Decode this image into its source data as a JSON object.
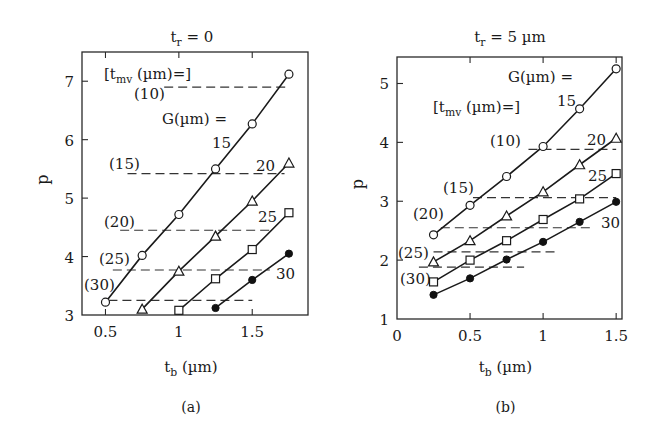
{
  "chart_data": [
    {
      "id": "a",
      "type": "line",
      "panel_label": "(a)",
      "title": "t_r = 0",
      "title_main": "t",
      "title_sub": "r",
      "title_rest": " = 0",
      "xlabel": "t_b (µm)",
      "xlabel_main": "t",
      "xlabel_sub": "b",
      "xlabel_rest": " (µm)",
      "ylabel": "p",
      "xlim": [
        0.34,
        1.88
      ],
      "ylim": [
        3,
        7.5
      ],
      "xticks": [
        0.5,
        1,
        1.5
      ],
      "xtick_labels": [
        "0.5",
        "1",
        "1.5"
      ],
      "yticks": [
        3,
        4,
        5,
        6,
        7
      ],
      "ytick_labels": [
        "3",
        "4",
        "5",
        "6",
        "7"
      ],
      "legend_header_g": "G(µm) =",
      "legend_header_tmv": "[t_mv (µm)=]",
      "series": [
        {
          "name": "G = 15",
          "marker": "circle-open",
          "x": [
            0.5,
            0.75,
            1.0,
            1.25,
            1.5,
            1.75
          ],
          "y": [
            3.22,
            4.02,
            4.72,
            5.5,
            6.27,
            7.12
          ],
          "label": "15"
        },
        {
          "name": "G = 20",
          "marker": "triangle-open",
          "x": [
            0.75,
            1.0,
            1.25,
            1.5,
            1.75
          ],
          "y": [
            3.1,
            3.75,
            4.35,
            4.95,
            5.6
          ],
          "label": "20"
        },
        {
          "name": "G = 25",
          "marker": "square-open",
          "x": [
            1.0,
            1.25,
            1.5,
            1.75
          ],
          "y": [
            3.08,
            3.62,
            4.12,
            4.75
          ],
          "label": "25"
        },
        {
          "name": "G = 30",
          "marker": "circle-filled",
          "x": [
            1.25,
            1.5,
            1.75
          ],
          "y": [
            3.12,
            3.6,
            4.05
          ],
          "label": "30"
        }
      ],
      "reference_lines": [
        {
          "label": "(10)",
          "t_mv": 10,
          "y": 6.9,
          "x_start": 0.9,
          "x_end": 1.73
        },
        {
          "label": "(15)",
          "t_mv": 15,
          "y": 5.42,
          "x_start": 0.65,
          "x_end": 1.72
        },
        {
          "label": "(20)",
          "t_mv": 20,
          "y": 4.45,
          "x_start": 0.6,
          "x_end": 1.63
        },
        {
          "label": "(25)",
          "t_mv": 25,
          "y": 3.77,
          "x_start": 0.55,
          "x_end": 1.62
        },
        {
          "label": "(30)",
          "t_mv": 30,
          "y": 3.25,
          "x_start": 0.52,
          "x_end": 1.5
        }
      ],
      "grid": false
    },
    {
      "id": "b",
      "type": "line",
      "panel_label": "(b)",
      "title": "t_r = 5 µm",
      "title_main": "t",
      "title_sub": "r",
      "title_rest": " = 5 µm",
      "xlabel": "t_b (µm)",
      "xlabel_main": "t",
      "xlabel_sub": "b",
      "xlabel_rest": " (µm)",
      "ylabel": "p",
      "xlim": [
        0,
        1.54
      ],
      "ylim": [
        1,
        5.45
      ],
      "xticks": [
        0,
        0.5,
        1,
        1.5
      ],
      "xtick_labels": [
        "0",
        "0.5",
        "1",
        "1.5"
      ],
      "yticks": [
        1,
        2,
        3,
        4,
        5
      ],
      "ytick_labels": [
        "1",
        "2",
        "3",
        "4",
        "5"
      ],
      "legend_header_g": "G(µm) =",
      "legend_header_tmv": "[t_mv (µm)=]",
      "series": [
        {
          "name": "G = 15",
          "marker": "circle-open",
          "x": [
            0.25,
            0.5,
            0.75,
            1.0,
            1.25,
            1.5
          ],
          "y": [
            2.43,
            2.93,
            3.42,
            3.93,
            4.57,
            5.25
          ],
          "label": "15"
        },
        {
          "name": "G = 20",
          "marker": "triangle-open",
          "x": [
            0.25,
            0.5,
            0.75,
            1.0,
            1.25,
            1.5
          ],
          "y": [
            1.97,
            2.33,
            2.75,
            3.16,
            3.62,
            4.07
          ],
          "label": "20"
        },
        {
          "name": "G = 25",
          "marker": "square-open",
          "x": [
            0.25,
            0.5,
            0.75,
            1.0,
            1.25,
            1.5
          ],
          "y": [
            1.63,
            2.0,
            2.33,
            2.69,
            3.04,
            3.47
          ],
          "label": "25"
        },
        {
          "name": "G = 30",
          "marker": "circle-filled",
          "x": [
            0.25,
            0.5,
            0.75,
            1.0,
            1.25,
            1.5
          ],
          "y": [
            1.41,
            1.69,
            2.01,
            2.31,
            2.65,
            2.99
          ],
          "label": "30"
        }
      ],
      "reference_lines": [
        {
          "label": "(10)",
          "t_mv": 10,
          "y": 3.88,
          "x_start": 0.9,
          "x_end": 1.5
        },
        {
          "label": "(15)",
          "t_mv": 15,
          "y": 3.06,
          "x_start": 0.52,
          "x_end": 1.5
        },
        {
          "label": "(20)",
          "t_mv": 20,
          "y": 2.55,
          "x_start": 0.3,
          "x_end": 1.35
        },
        {
          "label": "(25)",
          "t_mv": 25,
          "y": 2.14,
          "x_start": 0.25,
          "x_end": 1.1
        },
        {
          "label": "(30)",
          "t_mv": 30,
          "y": 1.88,
          "x_start": 0.15,
          "x_end": 0.87
        }
      ],
      "grid": false
    }
  ],
  "layout": {
    "a": {
      "left": 82,
      "right": 308,
      "top": 52,
      "bottom": 315,
      "title_x": 192,
      "title_y": 42,
      "panel_label_y": 412,
      "xlabel_y": 386
    },
    "b": {
      "left": 397,
      "right": 622,
      "top": 57,
      "bottom": 319,
      "title_x": 510,
      "title_y": 42,
      "panel_label_y": 412,
      "xlabel_y": 386
    }
  },
  "annotations": {
    "a": [
      {
        "text": "[t",
        "sub": "mv",
        "rest": " (µm)=]",
        "x": 104,
        "y": 79
      },
      {
        "text": "(10)",
        "x": 134,
        "y": 99
      },
      {
        "text": "G(µm) =",
        "x": 162,
        "y": 124
      },
      {
        "text": "15",
        "x": 212,
        "y": 148
      },
      {
        "text": "(15)",
        "x": 109,
        "y": 169
      },
      {
        "text": "20",
        "x": 256,
        "y": 171
      },
      {
        "text": "(20)",
        "x": 104,
        "y": 227
      },
      {
        "text": "25",
        "x": 258,
        "y": 222
      },
      {
        "text": "(25)",
        "x": 99,
        "y": 264
      },
      {
        "text": "(30)",
        "x": 84,
        "y": 290
      },
      {
        "text": "30",
        "x": 276,
        "y": 279
      }
    ],
    "b": [
      {
        "text": "G(µm) =",
        "x": 508,
        "y": 82
      },
      {
        "text": "[t",
        "sub": "mv",
        "rest": " (µm)=]",
        "x": 433,
        "y": 112
      },
      {
        "text": "15",
        "x": 557,
        "y": 106
      },
      {
        "text": "(10)",
        "x": 490,
        "y": 146
      },
      {
        "text": "20",
        "x": 587,
        "y": 145
      },
      {
        "text": "25",
        "x": 588,
        "y": 181
      },
      {
        "text": "(15)",
        "x": 443,
        "y": 193
      },
      {
        "text": "(20)",
        "x": 413,
        "y": 219
      },
      {
        "text": "30",
        "x": 601,
        "y": 228
      },
      {
        "text": "(25)",
        "x": 398,
        "y": 258
      },
      {
        "text": "(30)",
        "x": 400,
        "y": 284
      }
    ]
  }
}
